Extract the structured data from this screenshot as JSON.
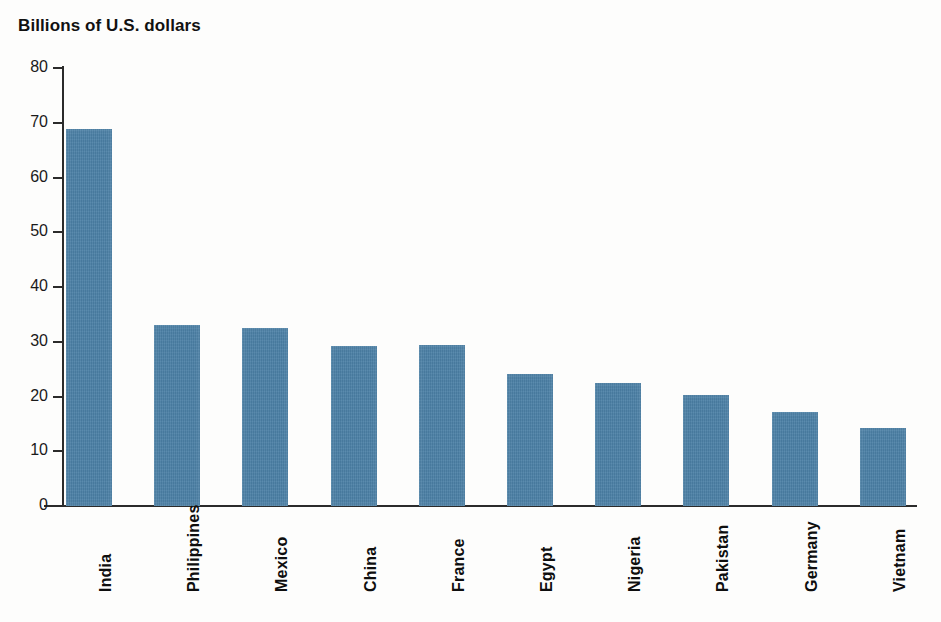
{
  "chart_data": {
    "type": "bar",
    "title": "Billions of U.S. dollars",
    "xlabel": "",
    "ylabel": "Billions of U.S. dollars",
    "ylim": [
      0,
      80
    ],
    "yticks": [
      0,
      10,
      20,
      30,
      40,
      50,
      60,
      70,
      80
    ],
    "grid": false,
    "legend": null,
    "bar_color": "#4a7fa5",
    "categories": [
      "India",
      "Philippines",
      "Mexico",
      "China",
      "France",
      "Egypt",
      "Nigeria",
      "Pakistan",
      "Germany",
      "Vietnam"
    ],
    "values": [
      68.9,
      33.0,
      32.5,
      29.3,
      29.4,
      24.2,
      22.5,
      20.2,
      17.2,
      14.3
    ],
    "series": [
      {
        "name": "Remittances received",
        "values": [
          68.9,
          33.0,
          32.5,
          29.3,
          29.4,
          24.2,
          22.5,
          20.2,
          17.2,
          14.3
        ]
      }
    ]
  },
  "axis": {
    "y_tick_labels": [
      "80",
      "70",
      "60",
      "50",
      "40",
      "30",
      "20",
      "10",
      "0"
    ]
  }
}
